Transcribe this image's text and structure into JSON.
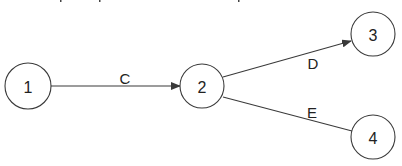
{
  "diagram": {
    "type": "directed-graph",
    "colors": {
      "stroke": "#3a3a3a",
      "text": "#222222",
      "background": "#ffffff"
    },
    "nodes": [
      {
        "id": "1",
        "label": "1",
        "cx": 28,
        "cy": 86,
        "r": 23
      },
      {
        "id": "2",
        "label": "2",
        "cx": 202,
        "cy": 86,
        "r": 22
      },
      {
        "id": "3",
        "label": "3",
        "cx": 373,
        "cy": 34,
        "r": 22
      },
      {
        "id": "4",
        "label": "4",
        "cx": 373,
        "cy": 137,
        "r": 22
      }
    ],
    "edges": [
      {
        "id": "C",
        "label": "C",
        "from": "1",
        "to": "2",
        "arrow": true,
        "label_x": 125,
        "label_y": 78
      },
      {
        "id": "D",
        "label": "D",
        "from": "2",
        "to": "3",
        "arrow": true,
        "label_x": 313,
        "label_y": 63
      },
      {
        "id": "E",
        "label": "E",
        "from": "2",
        "to": "4",
        "arrow": false,
        "label_x": 312,
        "label_y": 112
      }
    ]
  }
}
